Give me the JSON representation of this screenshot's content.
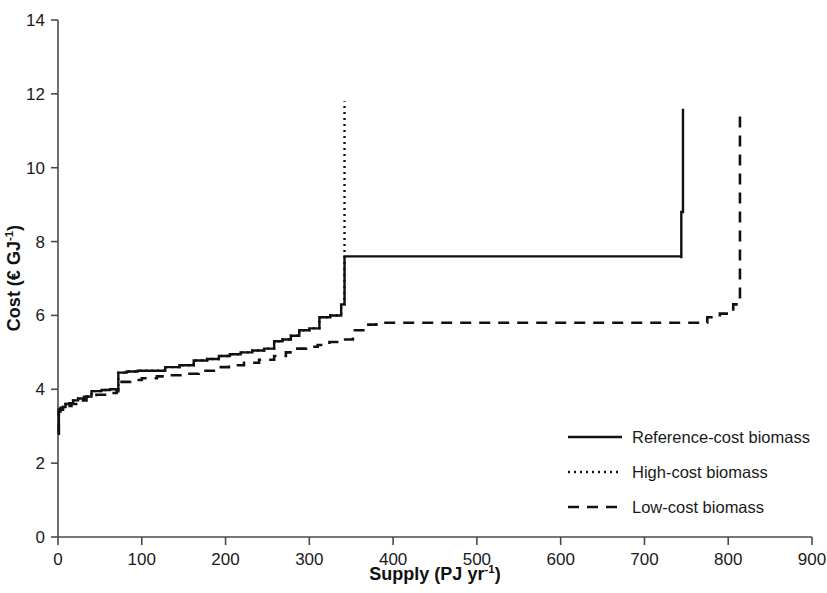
{
  "chart_data": {
    "type": "line",
    "title": "",
    "xlabel": "Supply (PJ yr-1)",
    "xlabel_base": "Supply (PJ yr",
    "xlabel_sup": "-1",
    "xlabel_tail": ")",
    "ylabel": "Cost (EUR GJ-1)",
    "ylabel_base": "Cost (€ GJ",
    "ylabel_sup": "-1",
    "ylabel_tail": ")",
    "xlim": [
      0,
      900
    ],
    "ylim": [
      0,
      14
    ],
    "xticks": [
      0,
      100,
      200,
      300,
      400,
      500,
      600,
      700,
      800,
      900
    ],
    "yticks": [
      0,
      2,
      4,
      6,
      8,
      10,
      12,
      14
    ],
    "xtick_labels": [
      "0",
      "100",
      "200",
      "300",
      "400",
      "500",
      "600",
      "700",
      "800",
      "900"
    ],
    "ytick_labels": [
      "0",
      "2",
      "4",
      "6",
      "8",
      "10",
      "12",
      "14"
    ],
    "grid": false,
    "legend_position": "inside-lower-right",
    "line_color": "#111111",
    "axis_color": "#4a4a4a",
    "series": [
      {
        "name": "Reference-cost biomass",
        "style": "solid",
        "dash": "none",
        "width": 2.4,
        "x": [
          0,
          1,
          3,
          6,
          9,
          13,
          18,
          24,
          31,
          40,
          52,
          62,
          72,
          82,
          95,
          110,
          128,
          145,
          162,
          178,
          192,
          205,
          218,
          232,
          246,
          258,
          268,
          278,
          288,
          300,
          312,
          325,
          338,
          342,
          342,
          744,
          744,
          746,
          746
        ],
        "y": [
          2.8,
          3.45,
          3.5,
          3.52,
          3.6,
          3.62,
          3.7,
          3.75,
          3.8,
          3.95,
          3.98,
          4.0,
          4.45,
          4.48,
          4.5,
          4.5,
          4.6,
          4.65,
          4.78,
          4.82,
          4.9,
          4.95,
          5.0,
          5.05,
          5.1,
          5.3,
          5.35,
          5.45,
          5.6,
          5.65,
          5.95,
          6.0,
          6.3,
          6.3,
          7.6,
          7.55,
          8.8,
          8.8,
          11.6
        ]
      },
      {
        "name": "High-cost biomass",
        "style": "dotted",
        "dash": "2,4",
        "width": 2.4,
        "x": [
          0,
          1,
          3,
          6,
          9,
          13,
          18,
          24,
          31,
          40,
          52,
          62,
          72,
          82,
          95,
          110,
          128,
          145,
          162,
          178,
          192,
          205,
          218,
          232,
          246,
          258,
          268,
          278,
          288,
          300,
          312,
          325,
          338,
          342,
          342
        ],
        "y": [
          2.8,
          3.45,
          3.5,
          3.52,
          3.6,
          3.62,
          3.7,
          3.75,
          3.8,
          3.95,
          3.98,
          4.0,
          4.45,
          4.48,
          4.5,
          4.5,
          4.6,
          4.65,
          4.78,
          4.82,
          4.9,
          4.95,
          5.0,
          5.05,
          5.1,
          5.3,
          5.35,
          5.45,
          5.6,
          5.65,
          5.95,
          6.0,
          6.3,
          6.3,
          11.8
        ]
      },
      {
        "name": "Low-cost biomass",
        "style": "dashed",
        "dash": "11,8",
        "width": 2.6,
        "x": [
          0,
          1,
          3,
          6,
          10,
          16,
          24,
          34,
          46,
          58,
          70,
          72,
          86,
          100,
          118,
          134,
          150,
          168,
          186,
          204,
          222,
          240,
          258,
          272,
          284,
          296,
          310,
          324,
          338,
          352,
          366,
          380,
          760,
          775,
          790,
          806,
          812,
          814
        ],
        "y": [
          2.8,
          3.4,
          3.45,
          3.5,
          3.55,
          3.6,
          3.7,
          3.8,
          3.85,
          3.9,
          3.95,
          4.2,
          4.25,
          4.3,
          4.35,
          4.38,
          4.42,
          4.5,
          4.6,
          4.65,
          4.72,
          4.8,
          4.9,
          5.0,
          5.1,
          5.15,
          5.2,
          5.28,
          5.35,
          5.6,
          5.75,
          5.8,
          5.8,
          5.95,
          6.05,
          6.3,
          6.3,
          11.6
        ]
      }
    ],
    "annotations": []
  },
  "legend": {
    "items": [
      {
        "label": "Reference-cost biomass",
        "style": "solid"
      },
      {
        "label": "High-cost biomass",
        "style": "dotted"
      },
      {
        "label": "Low-cost biomass",
        "style": "dashed"
      }
    ]
  }
}
